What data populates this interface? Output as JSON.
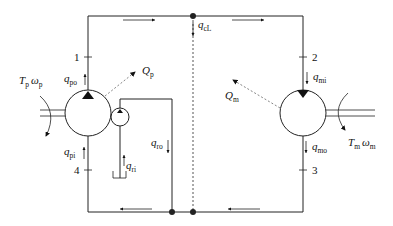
{
  "diagram": {
    "type": "hydrostatic transmission circuit",
    "colors": {
      "line": "#222222",
      "dashed": "#777777",
      "background": "#ffffff"
    },
    "port_labels": [
      "1",
      "2",
      "3",
      "4"
    ],
    "pump": {
      "name": "pump",
      "torque_speed": {
        "T": "T",
        "T_sub": "p",
        "w": "ω",
        "w_sub": "p"
      },
      "heat": {
        "main": "Q",
        "sub": "p"
      },
      "flow_out": {
        "main": "q",
        "sub": "po"
      },
      "flow_in": {
        "main": "q",
        "sub": "pi"
      }
    },
    "motor": {
      "name": "motor",
      "torque_speed": {
        "T": "T",
        "T_sub": "m",
        "w": "ω",
        "w_sub": "m"
      },
      "heat": {
        "main": "Q",
        "sub": "m"
      },
      "flow_in": {
        "main": "q",
        "sub": "mi"
      },
      "flow_out": {
        "main": "q",
        "sub": "mo"
      }
    },
    "charge_pump": {
      "flow_in": {
        "main": "q",
        "sub": "ri"
      },
      "flow_return": {
        "main": "q",
        "sub": "ro"
      }
    },
    "cross_leakage": {
      "main": "q",
      "sub": "cL"
    }
  }
}
